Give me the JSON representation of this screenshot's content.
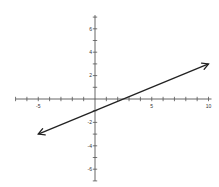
{
  "chart_data": {
    "type": "line",
    "title": "",
    "xlabel": "",
    "ylabel": "",
    "xlim": [
      -7,
      10
    ],
    "ylim": [
      -7,
      7
    ],
    "grid": false,
    "x_tick_labels": [
      "-5",
      "5",
      "10"
    ],
    "x_tick_label_values": [
      -5,
      5,
      10
    ],
    "y_tick_labels": [
      "6",
      "4",
      "2",
      "-2",
      "-4",
      "-6"
    ],
    "y_tick_label_values": [
      6,
      4,
      2,
      -2,
      -4,
      -6
    ],
    "series": [
      {
        "name": "line",
        "x": [
          -5,
          10
        ],
        "y": [
          -3,
          3
        ],
        "arrows": "both",
        "equation": "y = 0.4x - 1"
      }
    ],
    "colors": {
      "axis": "#555555",
      "line": "#222222"
    }
  }
}
